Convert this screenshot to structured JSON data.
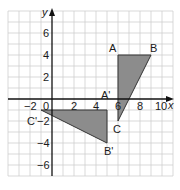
{
  "diagram": {
    "type": "coordinate-grid-transformation",
    "colors": {
      "grid": "#c8c8c8",
      "axis": "#111111",
      "shape_fill": "#8c8c8c",
      "shape_stroke": "#333333",
      "text": "#1a1a1a"
    },
    "axes": {
      "x_label": "x",
      "y_label": "y",
      "x_ticks": [
        {
          "value": -2,
          "label": "−2"
        },
        {
          "value": 0,
          "label": "0"
        },
        {
          "value": 2,
          "label": "2"
        },
        {
          "value": 4,
          "label": "4"
        },
        {
          "value": 6,
          "label": "6"
        },
        {
          "value": 8,
          "label": "8"
        },
        {
          "value": 10,
          "label": "10"
        }
      ],
      "y_ticks": [
        {
          "value": 6,
          "label": "6"
        },
        {
          "value": 4,
          "label": "4"
        },
        {
          "value": 2,
          "label": "2"
        },
        {
          "value": -2,
          "label": "−2"
        },
        {
          "value": -4,
          "label": "−4"
        },
        {
          "value": -6,
          "label": "−6"
        }
      ],
      "x_range": [
        -4,
        11
      ],
      "y_range": [
        -7,
        8
      ]
    },
    "shapes": [
      {
        "name": "triangle-ABC",
        "vertices": [
          {
            "label": "A",
            "x": 6,
            "y": 4
          },
          {
            "label": "B",
            "x": 9,
            "y": 4
          },
          {
            "label": "C",
            "x": 6,
            "y": -2
          }
        ]
      },
      {
        "name": "triangle-A'B'C'",
        "vertices": [
          {
            "label": "A'",
            "x": 5,
            "y": -1
          },
          {
            "label": "B'",
            "x": 5,
            "y": -4
          },
          {
            "label": "C'",
            "x": -1,
            "y": -1
          }
        ]
      }
    ],
    "labels": {
      "A": "A",
      "B": "B",
      "C": "C",
      "A_prime": "A'",
      "B_prime": "B'",
      "C_prime": "C'"
    }
  }
}
